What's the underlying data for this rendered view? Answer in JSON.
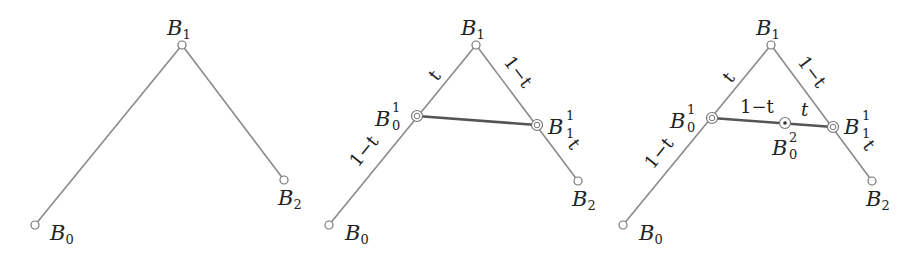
{
  "diagram": {
    "colors": {
      "edge": "#8a8a8a",
      "midsegment": "#555555",
      "text": "#222222"
    },
    "panels": [
      {
        "id": "panel-1",
        "points": {
          "B0": {
            "x": 35,
            "y": 225,
            "label": "B",
            "sub": "0",
            "sup": ""
          },
          "B1": {
            "x": 182,
            "y": 45,
            "label": "B",
            "sub": "1",
            "sup": ""
          },
          "B2": {
            "x": 284,
            "y": 180,
            "label": "B",
            "sub": "2",
            "sup": ""
          }
        },
        "edge_labels": []
      },
      {
        "id": "panel-2",
        "points": {
          "B0": {
            "x": 329,
            "y": 225,
            "label": "B",
            "sub": "0",
            "sup": ""
          },
          "B1": {
            "x": 476,
            "y": 45,
            "label": "B",
            "sub": "1",
            "sup": ""
          },
          "B2": {
            "x": 578,
            "y": 181,
            "label": "B",
            "sub": "2",
            "sup": ""
          },
          "B01": {
            "x": 417,
            "y": 116,
            "label": "B",
            "sub": "0",
            "sup": "1"
          },
          "B11": {
            "x": 537,
            "y": 125,
            "label": "B",
            "sub": "1",
            "sup": "1"
          }
        },
        "edge_labels": [
          "t",
          "1−t",
          "1−t",
          "t"
        ]
      },
      {
        "id": "panel-3",
        "points": {
          "B0": {
            "x": 623,
            "y": 225,
            "label": "B",
            "sub": "0",
            "sup": ""
          },
          "B1": {
            "x": 771,
            "y": 45,
            "label": "B",
            "sub": "1",
            "sup": ""
          },
          "B2": {
            "x": 872,
            "y": 181,
            "label": "B",
            "sub": "2",
            "sup": ""
          },
          "B01": {
            "x": 712,
            "y": 118,
            "label": "B",
            "sub": "0",
            "sup": "1"
          },
          "B11": {
            "x": 833,
            "y": 127,
            "label": "B",
            "sub": "1",
            "sup": "1"
          },
          "B02": {
            "x": 785,
            "y": 123,
            "label": "B",
            "sub": "0",
            "sup": "2"
          }
        },
        "edge_labels": [
          "t",
          "1−t",
          "1−t",
          "t",
          "1−t",
          "t"
        ]
      }
    ],
    "text": {
      "B": "B",
      "s0": "0",
      "s1": "1",
      "s2": "2",
      "t": "t",
      "one_minus_t": "1−t"
    }
  }
}
